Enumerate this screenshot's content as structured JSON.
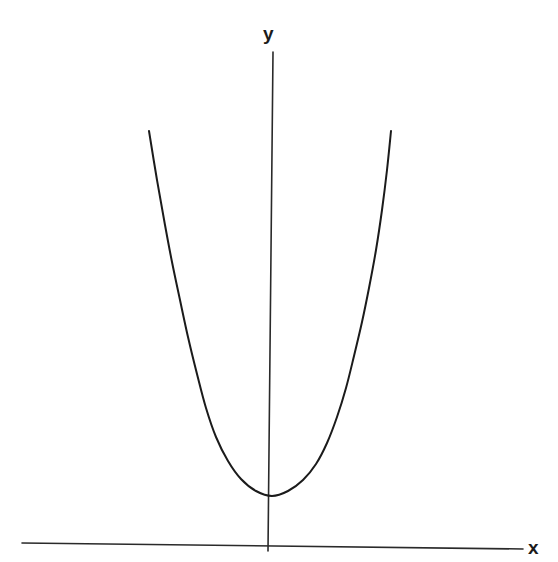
{
  "figure": {
    "title": "",
    "background_color": "#ffffff",
    "width": 558,
    "height": 562
  },
  "labels": {
    "y_axis": "y",
    "x_axis": "x"
  },
  "style": {
    "ink_color": "#1b1b1b",
    "curve_color": "#1b1b1b",
    "axis_color": "#2a2a2a",
    "axis_stroke_width": 1.6,
    "curve_stroke_width": 2.0
  },
  "chart_data": {
    "type": "line",
    "title": "",
    "subtitle": "",
    "xlabel": "x",
    "ylabel": "y",
    "grid": false,
    "legend": false,
    "legend_position": "none",
    "axis_ticks": [],
    "tick_labels": [],
    "axes": {
      "x_axis": {
        "label": "x",
        "drawn_from_px": [
          22,
          543
        ],
        "drawn_to_px": [
          523,
          549
        ],
        "arrow": false,
        "slightly_tilted": true
      },
      "y_axis": {
        "label": "y",
        "drawn_from_px": [
          273,
          52
        ],
        "drawn_to_px": [
          268,
          551
        ],
        "arrow": false,
        "slightly_tilted": true
      }
    },
    "vertex_px": [
      272,
      496
    ],
    "vertex_value": {
      "x": 0,
      "y": 1
    },
    "branch_endpoints_px": {
      "left": [
        149,
        131
      ],
      "right": [
        391,
        131
      ]
    },
    "xlim": [
      -2.1,
      2.1
    ],
    "ylim": [
      0,
      8.5
    ],
    "series": [
      {
        "name": "y = x^2 + 1",
        "points_px": [
          [
            149,
            131
          ],
          [
            157,
            180
          ],
          [
            165,
            225
          ],
          [
            172,
            262
          ],
          [
            180,
            300
          ],
          [
            188,
            337
          ],
          [
            197,
            374
          ],
          [
            206,
            408
          ],
          [
            216,
            437
          ],
          [
            228,
            461
          ],
          [
            241,
            479
          ],
          [
            256,
            491
          ],
          [
            272,
            496
          ],
          [
            288,
            491
          ],
          [
            303,
            480
          ],
          [
            316,
            464
          ],
          [
            327,
            443
          ],
          [
            337,
            417
          ],
          [
            346,
            388
          ],
          [
            354,
            356
          ],
          [
            362,
            322
          ],
          [
            369,
            288
          ],
          [
            376,
            250
          ],
          [
            382,
            210
          ],
          [
            387,
            170
          ],
          [
            391,
            131
          ]
        ],
        "x": [
          -2.0,
          -1.6,
          -1.2,
          -0.8,
          -0.4,
          0.0,
          0.4,
          0.8,
          1.2,
          1.6,
          2.0
        ],
        "y": [
          5.0,
          3.56,
          2.44,
          1.64,
          1.16,
          1.0,
          1.16,
          1.64,
          2.44,
          3.56,
          5.0
        ]
      }
    ]
  }
}
